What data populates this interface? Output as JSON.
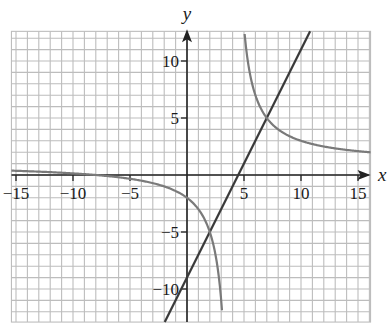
{
  "chart_data": {
    "type": "line",
    "title": "",
    "xlabel": "x",
    "ylabel": "y",
    "xlim": [
      -15.4,
      16.1
    ],
    "ylim": [
      -12.9,
      12.6
    ],
    "grid": true,
    "grid_step": 1,
    "x_ticks": [
      -15,
      -10,
      -5,
      5,
      10,
      15
    ],
    "x_tick_labels": [
      "−15",
      "−10",
      "−5",
      "5",
      "10",
      "15"
    ],
    "y_ticks": [
      -10,
      -5,
      5,
      10
    ],
    "y_tick_labels": [
      "−10",
      "−5",
      "5",
      "10"
    ],
    "series": [
      {
        "name": "line",
        "equation": "y = 2x - 9",
        "slope": 2,
        "intercept": -9,
        "color": "#3a3a3a",
        "x": [
          -1.95,
          10.8
        ],
        "y": [
          -12.9,
          12.6
        ]
      },
      {
        "name": "hyperbola",
        "equation": "y = 12/(x - 4) + 1",
        "vertical_asymptote": 4,
        "horizontal_asymptote": 1,
        "color": "#7a7a7a",
        "points_left_branch": [
          [
            -15,
            0.37
          ],
          [
            -10,
            0.14
          ],
          [
            -5,
            -0.33
          ],
          [
            0,
            -2
          ],
          [
            2,
            -5
          ],
          [
            3,
            -11
          ],
          [
            3.14,
            -12.9
          ]
        ],
        "points_right_branch": [
          [
            5.03,
            12.6
          ],
          [
            6,
            7
          ],
          [
            7,
            5
          ],
          [
            10,
            3
          ],
          [
            15,
            2.09
          ],
          [
            16.1,
            1.99
          ]
        ]
      }
    ],
    "intersections": [
      [
        2,
        -5
      ],
      [
        7,
        5
      ]
    ],
    "annotations": []
  },
  "axes": {
    "x_label": "x",
    "y_label": "y"
  }
}
